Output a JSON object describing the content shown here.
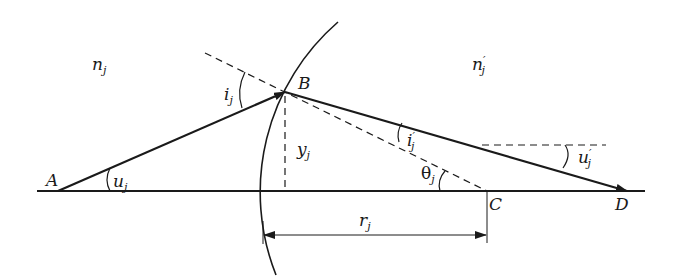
{
  "diagram": {
    "media": {
      "left_index": {
        "base": "n",
        "prime": "",
        "sub": "j"
      },
      "right_index": {
        "base": "n",
        "prime": "′",
        "sub": "j"
      }
    },
    "points": {
      "A": "A",
      "B": "B",
      "C": "C",
      "D": "D"
    },
    "angles": {
      "incidence": {
        "base": "i",
        "prime": "",
        "sub": "j"
      },
      "refraction": {
        "base": "i",
        "prime": "′",
        "sub": "j"
      },
      "aperture_object": {
        "base": "u",
        "prime": "",
        "sub": "j"
      },
      "aperture_image": {
        "base": "u",
        "prime": "′",
        "sub": "j"
      },
      "normal_angle": {
        "base": "θ",
        "prime": "",
        "sub": "j"
      }
    },
    "lengths": {
      "height": {
        "base": "y",
        "prime": "",
        "sub": "j"
      },
      "radius": {
        "base": "r",
        "prime": "",
        "sub": "j"
      }
    },
    "colors": {
      "line": "#1a1a1a",
      "background": "#ffffff"
    }
  }
}
